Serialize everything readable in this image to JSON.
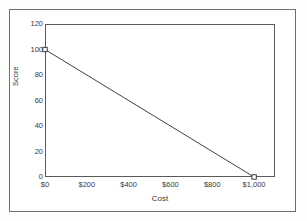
{
  "scan": {
    "top_remnant_text": "",
    "background_color": "#fdfdfc",
    "frame_color": "#6f6f6f"
  },
  "chart_data": {
    "type": "line",
    "title": "",
    "xlabel": "Cost",
    "ylabel": "Score",
    "xlim": [
      0,
      1100
    ],
    "ylim": [
      0,
      120
    ],
    "grid": false,
    "legend": "none",
    "line_color": "#2b2b2b",
    "marker": "open-square",
    "x_tick_values": [
      0,
      200,
      400,
      600,
      800,
      1000
    ],
    "x_tick_labels": [
      "$0",
      "$200",
      "$400",
      "$600",
      "$800",
      "$1,000"
    ],
    "y_tick_values": [
      0,
      20,
      40,
      60,
      80,
      100,
      120
    ],
    "y_tick_labels": [
      "0",
      "20",
      "40",
      "60",
      "80",
      "100",
      "120"
    ],
    "series": [
      {
        "name": "Score vs Cost",
        "x": [
          0,
          1000
        ],
        "values": [
          100,
          0
        ]
      }
    ]
  }
}
